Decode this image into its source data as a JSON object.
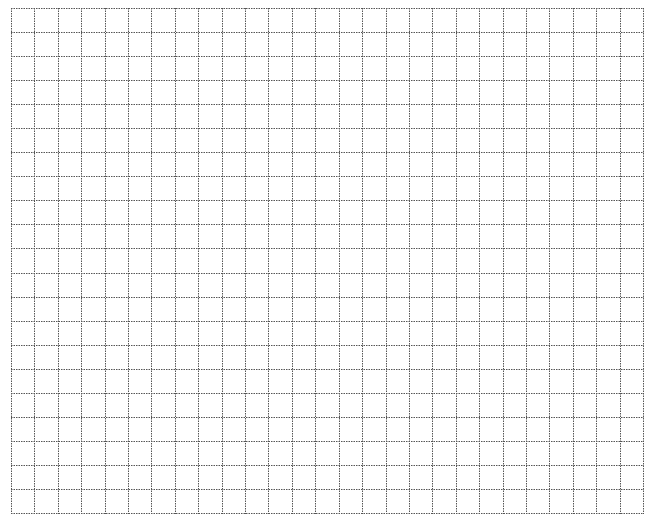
{
  "grid": {
    "columns": 27,
    "rows": 21,
    "width": 632,
    "height": 505,
    "line_color": "#555555",
    "line_style": "dotted",
    "background": "#ffffff"
  }
}
